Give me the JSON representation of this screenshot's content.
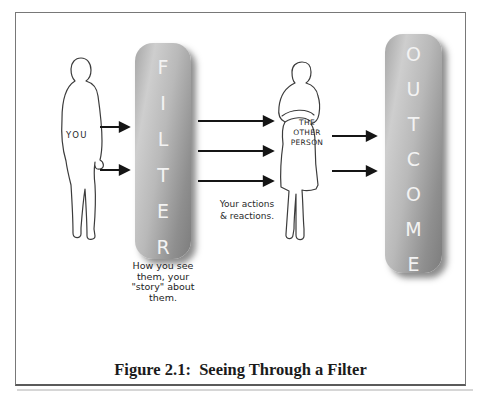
{
  "figure": {
    "caption": "Figure 2.1:  Seeing Through a Filter",
    "left_person": {
      "label": "YOU"
    },
    "filter_bar": {
      "label": "FILTER"
    },
    "right_person": {
      "label": "THE\nOTHER\nPERSON"
    },
    "outcome_bar": {
      "label": "OUTCOME"
    },
    "actions_note": "Your actions\n& reactions.",
    "filter_note": "How you see\nthem, your\n\"story\" about\nthem.",
    "colors": {
      "bar_gradient_light": "#cecece",
      "bar_gradient_dark": "#7d7d7d",
      "bar_text": "#f3f3f3",
      "outline": "#3c3c3c",
      "arrow": "#151515",
      "border": "#787878"
    }
  }
}
